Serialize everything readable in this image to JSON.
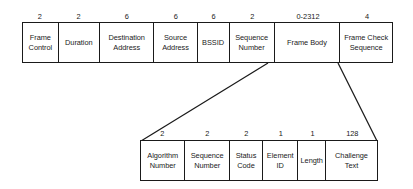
{
  "diagram": {
    "top_frame": {
      "name": "802.11 MAC frame",
      "fields": [
        {
          "label": "Frame\nControl",
          "size": "2"
        },
        {
          "label": "Duration",
          "size": "2"
        },
        {
          "label": "Destination\nAddress",
          "size": "6"
        },
        {
          "label": "Source\nAddress",
          "size": "6"
        },
        {
          "label": "BSSID",
          "size": "6"
        },
        {
          "label": "Sequence\nNumber",
          "size": "2"
        },
        {
          "label": "Frame Body",
          "size": "0-2312"
        },
        {
          "label": "Frame Check\nSequence",
          "size": "4"
        }
      ]
    },
    "expanded_frame": {
      "name": "Authentication frame body",
      "expands_from": "Frame Body",
      "fields": [
        {
          "label": "Algorithm\nNumber",
          "size": "2"
        },
        {
          "label": "Sequence\nNumber",
          "size": "2"
        },
        {
          "label": "Status\nCode",
          "size": "2"
        },
        {
          "label": "Element\nID",
          "size": "1"
        },
        {
          "label": "Length",
          "size": "1"
        },
        {
          "label": "Challenge\nText",
          "size": "128"
        }
      ]
    },
    "colors": {
      "stroke": "#1a1a1a",
      "background": "#ffffff"
    }
  }
}
